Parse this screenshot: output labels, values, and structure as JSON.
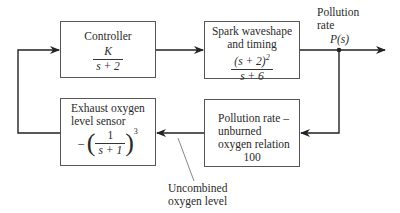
{
  "diagram": {
    "type": "feedback-control-block-diagram",
    "blocks": {
      "controller": {
        "title": "Controller",
        "tf_num": "K",
        "tf_den": "s + 2"
      },
      "spark": {
        "title_line1": "Spark waveshape",
        "title_line2": "and timing",
        "tf_num": "(s + 2)",
        "tf_num_exp": "2",
        "tf_den": "s + 6"
      },
      "pollution_relation": {
        "line1": "Pollution rate –",
        "line2": "unburned",
        "line3": "oxygen relation",
        "gain": "100"
      },
      "sensor": {
        "line1": "Exhaust oxygen",
        "line2": "level sensor",
        "sign": "–",
        "tf_num": "1",
        "tf_den": "s + 1",
        "exp": "3"
      }
    },
    "labels": {
      "output_line1": "Pollution",
      "output_line2": "rate",
      "output_signal": "P(s)",
      "uncombined_line1": "Uncombined",
      "uncombined_line2": "oxygen level"
    },
    "connections": [
      {
        "from": "sensor",
        "to": "controller",
        "via": "left feedback path"
      },
      {
        "from": "controller",
        "to": "spark"
      },
      {
        "from": "spark",
        "to": "output P(s)"
      },
      {
        "from": "output P(s) pickoff",
        "to": "pollution_relation"
      },
      {
        "from": "pollution_relation",
        "to": "sensor",
        "signal": "Uncombined oxygen level"
      }
    ],
    "colors": {
      "line": "#222222",
      "box_border": "#555555"
    }
  }
}
